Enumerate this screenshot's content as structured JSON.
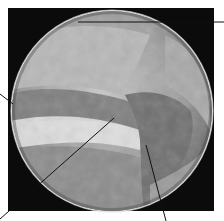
{
  "figure": {
    "background_color": "#0b0b0b",
    "page_color": "#ffffff",
    "globe": {
      "center": [
        112,
        111
      ],
      "radius": 103,
      "tone_colors": [
        "#f2f2f2",
        "#bdbdbd",
        "#8a8a8a",
        "#5e5e5e"
      ]
    },
    "leader_lines": [
      {
        "id": "top",
        "x1": 78,
        "y1": 22,
        "x2": 224,
        "y2": 22
      },
      {
        "id": "left",
        "x1": 0,
        "y1": 94,
        "x2": 13,
        "y2": 104
      },
      {
        "id": "diagonal",
        "x1": 0,
        "y1": 219,
        "x2": 114,
        "y2": 118
      },
      {
        "id": "bottom-right",
        "x1": 146,
        "y1": 145,
        "x2": 166,
        "y2": 221
      }
    ]
  }
}
